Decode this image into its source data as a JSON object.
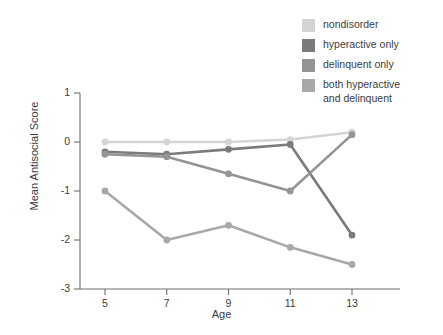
{
  "chart_data": {
    "type": "line",
    "title": "",
    "xlabel": "Age",
    "ylabel": "Mean Antisocial Score",
    "x": [
      5,
      7,
      9,
      11,
      13
    ],
    "xticklabels": [
      "5",
      "7",
      "9",
      "11",
      "13"
    ],
    "yticklabels": [
      "1",
      "0",
      "-1",
      "-2",
      "-3"
    ],
    "yticks": [
      1,
      0,
      -1,
      -2,
      -3
    ],
    "xlim": [
      4,
      14
    ],
    "ylim": [
      -3,
      1
    ],
    "grid": false,
    "legend_position": "top-right",
    "series": [
      {
        "name": "nondisorder",
        "color": "#d4d4d4",
        "values": [
          0.0,
          0.0,
          0.0,
          0.05,
          0.2
        ]
      },
      {
        "name": "hyperactive only",
        "color": "#7b7b7b",
        "values": [
          -0.2,
          -0.25,
          -0.15,
          -0.05,
          -1.9
        ]
      },
      {
        "name": "delinquent only",
        "color": "#949494",
        "values": [
          -0.25,
          -0.3,
          -0.65,
          -1.0,
          0.15
        ]
      },
      {
        "name": "both hyperactive and delinquent",
        "color": "#a8a8a8",
        "values": [
          -1.0,
          -2.0,
          -1.7,
          -2.15,
          -2.5
        ]
      }
    ]
  },
  "legend": {
    "items": [
      {
        "label": "nondisorder",
        "color": "#d4d4d4"
      },
      {
        "label": "hyperactive only",
        "color": "#7b7b7b"
      },
      {
        "label": "delinquent only",
        "color": "#949494"
      },
      {
        "label": "both hyperactive\nand delinquent",
        "color": "#a8a8a8"
      }
    ]
  },
  "axes": {
    "x_title": "Age",
    "y_title": "Mean Antisocial Score",
    "x_ticks": [
      "5",
      "7",
      "9",
      "11",
      "13"
    ],
    "y_ticks": [
      "1",
      "0",
      "-1",
      "-2",
      "-3"
    ]
  }
}
